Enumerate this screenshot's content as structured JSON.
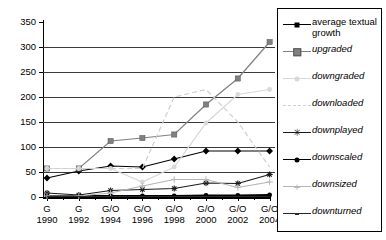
{
  "chart_data": {
    "type": "line",
    "title": "",
    "xlabel": "",
    "ylabel": "",
    "ylim": [
      0,
      350
    ],
    "ytick_step": 50,
    "grid": true,
    "legend_position": "right",
    "categories": [
      "1990",
      "1992",
      "1994",
      "1996",
      "1998",
      "2000",
      "2002",
      "2004"
    ],
    "category_prefixes": [
      "G",
      "G",
      "G/O",
      "G/O",
      "G/O",
      "G/O",
      "G/O",
      "G/O"
    ],
    "ytick_labels": [
      "0",
      "50",
      "100",
      "150",
      "200",
      "250",
      "300",
      "350"
    ],
    "series": [
      {
        "name": "average textual growth",
        "marker": "diamond",
        "color": "#000000",
        "values": [
          38,
          52,
          62,
          60,
          76,
          92,
          92,
          92
        ]
      },
      {
        "name": "upgraded",
        "marker": "square",
        "color": "#808080",
        "values": [
          57,
          57,
          112,
          118,
          125,
          185,
          237,
          310
        ]
      },
      {
        "name": "downgraded",
        "marker": "dot-light",
        "color": "#d8d8d8",
        "values": [
          57,
          57,
          57,
          30,
          60,
          148,
          205,
          215
        ]
      },
      {
        "name": "downloaded",
        "marker": "dash-light",
        "color": "#cfcfcf",
        "values": [
          57,
          57,
          57,
          57,
          200,
          215,
          150,
          60
        ]
      },
      {
        "name": "downplayed",
        "marker": "star",
        "color": "#1a1a1a",
        "values": [
          8,
          4,
          13,
          15,
          17,
          28,
          27,
          45
        ]
      },
      {
        "name": "downscaled",
        "marker": "dot",
        "color": "#000000",
        "values": [
          2,
          2,
          2,
          2,
          2,
          3,
          3,
          4
        ]
      },
      {
        "name": "downsized",
        "marker": "plus",
        "color": "#b5b5b5",
        "values": [
          2,
          2,
          8,
          22,
          35,
          35,
          19,
          30
        ]
      },
      {
        "name": "downturned",
        "marker": "line",
        "color": "#2a2a2a",
        "values": [
          1,
          1,
          1,
          1,
          1,
          1,
          1,
          1
        ]
      }
    ]
  },
  "legend": {
    "items": [
      {
        "label": "average textual growth",
        "italic": false
      },
      {
        "label": "upgraded",
        "italic": true
      },
      {
        "label": "downgraded",
        "italic": true
      },
      {
        "label": "downloaded",
        "italic": true
      },
      {
        "label": "downplayed",
        "italic": true
      },
      {
        "label": "downscaled",
        "italic": true
      },
      {
        "label": "downsized",
        "italic": true
      },
      {
        "label": "downturned",
        "italic": true
      }
    ]
  }
}
